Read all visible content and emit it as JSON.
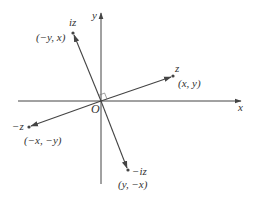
{
  "diagram": {
    "axes": {
      "x_label": "x",
      "y_label": "y",
      "origin_label": "O"
    },
    "points": [
      {
        "id": "z",
        "name": "z",
        "coords": "(x, y)"
      },
      {
        "id": "iz",
        "name": "iz",
        "coords": "(−y, x)"
      },
      {
        "id": "neg_z",
        "name": "−z",
        "coords": "(−x, −y)"
      },
      {
        "id": "neg_iz",
        "name": "−iz",
        "coords": "(y, −x)"
      }
    ],
    "colors": {
      "line": "#444444",
      "text": "#333333",
      "background": "#ffffff"
    }
  }
}
